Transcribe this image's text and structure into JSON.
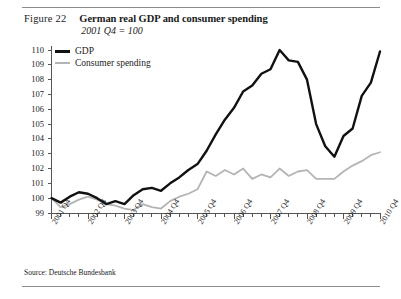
{
  "figure": {
    "label": "Figure 22",
    "title": "German real GDP and consumer spending",
    "subtitle": "2001 Q4 = 100",
    "source": "Source: Deutsche Bundesbank"
  },
  "colors": {
    "gdp": "#111111",
    "consumer": "#b4b4b4",
    "axis": "#555555",
    "rule": "#8b8b8b"
  },
  "legend": {
    "items": [
      {
        "label": "GDP",
        "key": "gdp"
      },
      {
        "label": "Consumer spending",
        "key": "consumer"
      }
    ]
  },
  "chart_data": {
    "type": "line",
    "title": "German real GDP and consumer spending",
    "subtitle": "2001 Q4 = 100",
    "xlabel": "",
    "ylabel": "",
    "ylim": [
      99,
      110
    ],
    "yticks": [
      99,
      100,
      101,
      102,
      103,
      104,
      105,
      106,
      107,
      108,
      109,
      110
    ],
    "ytick_labels": [
      "99",
      "100",
      "101",
      "102",
      "103",
      "104",
      "105",
      "106",
      "107",
      "108",
      "109",
      "110"
    ],
    "grid": false,
    "legend_position": "top-left",
    "xtick_labels": [
      "2001 Q4",
      "2002 Q4",
      "2003 Q4",
      "2004 Q4",
      "2005 Q4",
      "2006 Q4",
      "2007 Q4",
      "2008 Q4",
      "2009 Q4",
      "2010 Q4"
    ],
    "x_labeled_indices": [
      0,
      4,
      8,
      12,
      16,
      20,
      24,
      28,
      32,
      36
    ],
    "x": [
      "2001 Q4",
      "2002 Q1",
      "2002 Q2",
      "2002 Q3",
      "2002 Q4",
      "2003 Q1",
      "2003 Q2",
      "2003 Q3",
      "2003 Q4",
      "2004 Q1",
      "2004 Q2",
      "2004 Q3",
      "2004 Q4",
      "2005 Q1",
      "2005 Q2",
      "2005 Q3",
      "2005 Q4",
      "2006 Q1",
      "2006 Q2",
      "2006 Q3",
      "2006 Q4",
      "2007 Q1",
      "2007 Q2",
      "2007 Q3",
      "2007 Q4",
      "2008 Q1",
      "2008 Q2",
      "2008 Q3",
      "2008 Q4",
      "2009 Q1",
      "2009 Q2",
      "2009 Q3",
      "2009 Q4",
      "2010 Q1",
      "2010 Q2",
      "2010 Q3",
      "2010 Q4"
    ],
    "series": [
      {
        "name": "GDP",
        "color": "#111111",
        "values": [
          100.0,
          99.7,
          100.1,
          100.4,
          100.3,
          100.0,
          99.6,
          99.8,
          99.6,
          100.2,
          100.6,
          100.7,
          100.5,
          101.0,
          101.4,
          101.9,
          102.3,
          103.2,
          104.3,
          105.3,
          106.1,
          107.2,
          107.6,
          108.4,
          108.7,
          110.0,
          109.3,
          109.2,
          108.0,
          105.0,
          103.5,
          102.8,
          104.2,
          104.7,
          106.9,
          107.8,
          109.9
        ]
      },
      {
        "name": "Consumer spending",
        "color": "#b4b4b4",
        "values": [
          100.0,
          99.4,
          99.6,
          99.9,
          100.1,
          99.9,
          99.6,
          99.5,
          99.3,
          99.2,
          99.6,
          99.4,
          99.3,
          99.8,
          100.1,
          100.3,
          100.6,
          101.8,
          101.5,
          101.9,
          101.6,
          102.0,
          101.3,
          101.6,
          101.4,
          102.0,
          101.5,
          101.8,
          101.9,
          101.3,
          101.3,
          101.3,
          101.8,
          102.2,
          102.5,
          102.9,
          103.1
        ]
      }
    ]
  }
}
